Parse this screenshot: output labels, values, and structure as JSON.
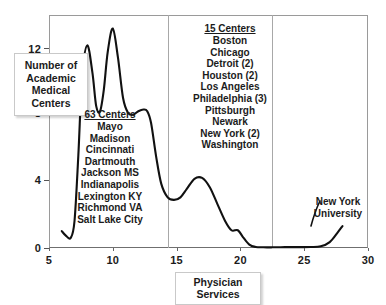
{
  "chart_data": {
    "type": "line",
    "title": "",
    "xlabel": "Physician Services",
    "ylabel": "Number of\nAcademic\nMedical\nCenters",
    "xlim": [
      5,
      30
    ],
    "ylim": [
      0,
      13.8
    ],
    "xticks": [
      5,
      10,
      15,
      20,
      25,
      30
    ],
    "yticks": [
      0,
      4,
      8,
      12
    ],
    "grid": false,
    "legend": "none",
    "series": [
      {
        "name": "Academic Medical Centers density",
        "x": [
          6.0,
          6.3,
          6.7,
          7.0,
          7.3,
          7.6,
          8.0,
          8.4,
          8.7,
          9.0,
          9.3,
          9.6,
          10.0,
          10.4,
          10.8,
          11.2,
          11.6,
          12.0,
          12.4,
          12.7,
          13.0,
          13.4,
          13.8,
          14.3,
          14.8,
          15.3,
          15.8,
          16.4,
          17.0,
          17.6,
          18.2,
          18.8,
          19.3,
          19.8,
          20.2,
          20.7,
          21.2,
          21.8,
          22.5,
          23.5,
          24.5,
          25.5,
          26.3,
          27.0,
          27.6,
          28.0
        ],
        "y": [
          1.0,
          0.75,
          0.6,
          1.6,
          5.5,
          10.2,
          12.0,
          10.4,
          8.4,
          8.1,
          9.4,
          11.6,
          13.0,
          11.3,
          8.9,
          8.0,
          7.9,
          8.1,
          8.2,
          8.1,
          7.4,
          5.4,
          3.8,
          3.0,
          2.85,
          3.0,
          3.5,
          4.1,
          4.15,
          3.6,
          2.6,
          1.6,
          1.05,
          1.05,
          0.65,
          0.2,
          0.06,
          0.04,
          0.04,
          0.05,
          0.05,
          0.06,
          0.1,
          0.35,
          0.9,
          1.3
        ]
      }
    ],
    "vertical_dividers": [
      14.3,
      22.5
    ],
    "annotations": [
      {
        "id": "group-63",
        "heading": "63 Centers",
        "entries": [
          "Mayo",
          "Madison",
          "Cincinnati",
          "Dartmouth",
          "Jackson MS",
          "Indianapolis",
          "Lexington KY",
          "Richmond VA",
          "Salt Lake City"
        ]
      },
      {
        "id": "group-15",
        "heading": "15 Centers",
        "entries": [
          "Boston",
          "Chicago",
          "Detroit (2)",
          "Houston (2)",
          "Los Angeles",
          "Philadelphia (3)",
          "Pittsburgh",
          "Newark",
          "New York (2)",
          "Washington"
        ]
      },
      {
        "id": "group-nyu",
        "heading": "",
        "entries": [
          "New York",
          "University"
        ]
      }
    ]
  },
  "axes": {
    "y_label_lines": [
      "Number of",
      "Academic",
      "Medical",
      "Centers"
    ],
    "y_tick_labels": [
      "12",
      "8",
      "4",
      "0"
    ],
    "x_tick_labels": [
      "5",
      "10",
      "15",
      "20",
      "25",
      "30"
    ],
    "x_label": "Physician Services"
  },
  "colors": {
    "curve": "#111111",
    "frame": "#9a9a9a",
    "divider": "#a8a8a8",
    "text": "#1b1b1b",
    "background": "#ffffff"
  }
}
